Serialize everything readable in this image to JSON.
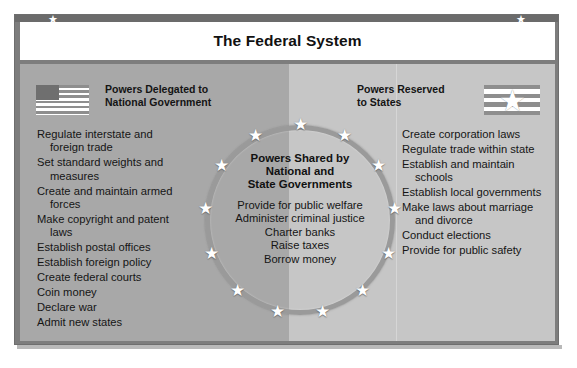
{
  "poster": {
    "title": "The Federal System",
    "corner_star_icon": "star-icon"
  },
  "left_panel": {
    "heading": "Powers Delegated to\nNational Government",
    "heading_line1": "Powers Delegated to",
    "heading_line2": "National Government",
    "flag_icon": "us-flag-icon",
    "powers": [
      "Regulate interstate and foreign trade",
      "Set standard weights and measures",
      "Create and maintain armed forces",
      "Make copyright and patent laws",
      "Establish postal offices",
      "Establish foreign policy",
      "Create federal courts",
      "Coin money",
      "Declare war",
      "Admit new states"
    ]
  },
  "right_panel": {
    "heading_line1": "Powers Reserved",
    "heading_line2": "to States",
    "flag_icon": "state-flag-star-icon",
    "powers": [
      "Create corporation laws",
      "Regulate trade within state",
      "Establish and maintain schools",
      "Establish local governments",
      "Make laws about marriage and divorce",
      "Conduct elections",
      "Provide for public safety"
    ]
  },
  "center_circle": {
    "title_line1": "Powers Shared by",
    "title_line2": "National and",
    "title_line3": "State Governments",
    "ring_star_icon": "star-icon",
    "ring_star_count": 13,
    "powers": [
      "Provide for public welfare",
      "Administer criminal justice",
      "Charter banks",
      "Raise taxes",
      "Borrow money"
    ]
  },
  "colors": {
    "frame": "#7d7d7d",
    "left_panel_bg": "#a8a8a8",
    "right_panel_bg": "#c6c6c6",
    "title_bar_bg": "#ffffff",
    "ring": "#9a9a9a",
    "text": "#151515"
  }
}
